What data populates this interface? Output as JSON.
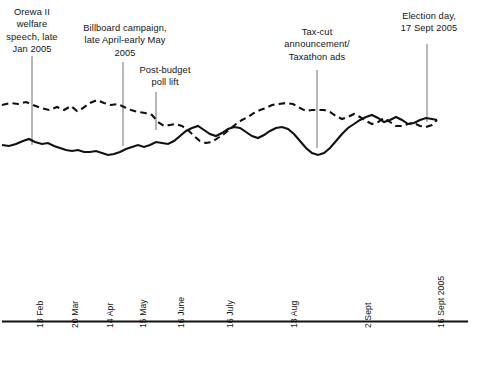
{
  "chart_data": {
    "type": "line",
    "title": "",
    "subtitle": "",
    "xlabel": "",
    "ylabel": "",
    "grid": false,
    "legend_position": "none",
    "x_axis": {
      "tick_labels": [
        "13 Feb",
        "20 Mar",
        "14 Apr",
        "15 May",
        "16 June",
        "16 July",
        "13 Aug",
        "2 Sept",
        "16 Sept 2005"
      ],
      "tick_positions_px": [
        31,
        66,
        101,
        134,
        172,
        221,
        285,
        359,
        432
      ],
      "range_start": "13 Feb",
      "range_end": "16 Sept 2005"
    },
    "y_axis": {
      "visible": false,
      "note": "no tick labels or axis line shown"
    },
    "series": [
      {
        "name": "dashed-series",
        "style": "dashed",
        "color": "#111111",
        "points": [
          [
            2,
            105
          ],
          [
            10,
            103
          ],
          [
            18,
            104
          ],
          [
            26,
            102
          ],
          [
            33,
            105
          ],
          [
            41,
            108
          ],
          [
            49,
            110
          ],
          [
            57,
            107
          ],
          [
            64,
            110
          ],
          [
            71,
            106
          ],
          [
            77,
            111
          ],
          [
            83,
            108
          ],
          [
            90,
            103
          ],
          [
            97,
            100
          ],
          [
            104,
            103
          ],
          [
            111,
            105
          ],
          [
            118,
            104
          ],
          [
            124,
            107
          ],
          [
            131,
            110
          ],
          [
            138,
            112
          ],
          [
            145,
            113
          ],
          [
            152,
            115
          ],
          [
            158,
            122
          ],
          [
            164,
            126
          ],
          [
            170,
            125
          ],
          [
            176,
            124
          ],
          [
            182,
            126
          ],
          [
            188,
            130
          ],
          [
            194,
            136
          ],
          [
            200,
            141
          ],
          [
            206,
            143
          ],
          [
            212,
            142
          ],
          [
            218,
            138
          ],
          [
            224,
            134
          ],
          [
            230,
            129
          ],
          [
            236,
            124
          ],
          [
            242,
            120
          ],
          [
            248,
            117
          ],
          [
            254,
            113
          ],
          [
            260,
            110
          ],
          [
            266,
            108
          ],
          [
            272,
            105
          ],
          [
            279,
            104
          ],
          [
            286,
            103
          ],
          [
            293,
            104
          ],
          [
            300,
            108
          ],
          [
            306,
            111
          ],
          [
            312,
            110
          ],
          [
            318,
            110
          ],
          [
            324,
            110
          ],
          [
            330,
            112
          ],
          [
            336,
            116
          ],
          [
            342,
            119
          ],
          [
            348,
            117
          ],
          [
            354,
            114
          ],
          [
            360,
            117
          ],
          [
            366,
            121
          ],
          [
            372,
            124
          ],
          [
            378,
            122
          ],
          [
            384,
            118
          ],
          [
            390,
            122
          ],
          [
            396,
            126
          ],
          [
            402,
            126
          ],
          [
            408,
            124
          ],
          [
            414,
            123
          ],
          [
            420,
            126
          ],
          [
            426,
            127
          ],
          [
            432,
            125
          ],
          [
            437,
            120
          ]
        ]
      },
      {
        "name": "solid-series",
        "style": "solid",
        "color": "#111111",
        "points": [
          [
            2,
            145
          ],
          [
            9,
            146
          ],
          [
            16,
            144
          ],
          [
            23,
            141
          ],
          [
            29,
            139
          ],
          [
            35,
            142
          ],
          [
            42,
            144
          ],
          [
            48,
            143
          ],
          [
            54,
            146
          ],
          [
            60,
            148
          ],
          [
            66,
            150
          ],
          [
            72,
            151
          ],
          [
            78,
            150
          ],
          [
            84,
            152
          ],
          [
            90,
            152
          ],
          [
            96,
            151
          ],
          [
            102,
            153
          ],
          [
            108,
            155
          ],
          [
            114,
            154
          ],
          [
            120,
            152
          ],
          [
            126,
            149
          ],
          [
            132,
            147
          ],
          [
            138,
            145
          ],
          [
            144,
            147
          ],
          [
            150,
            145
          ],
          [
            156,
            142
          ],
          [
            162,
            143
          ],
          [
            168,
            144
          ],
          [
            174,
            141
          ],
          [
            180,
            136
          ],
          [
            186,
            131
          ],
          [
            192,
            128
          ],
          [
            198,
            126
          ],
          [
            204,
            130
          ],
          [
            210,
            134
          ],
          [
            216,
            136
          ],
          [
            222,
            133
          ],
          [
            228,
            129
          ],
          [
            234,
            127
          ],
          [
            240,
            128
          ],
          [
            246,
            132
          ],
          [
            252,
            136
          ],
          [
            258,
            138
          ],
          [
            264,
            135
          ],
          [
            270,
            131
          ],
          [
            276,
            128
          ],
          [
            282,
            127
          ],
          [
            288,
            129
          ],
          [
            294,
            134
          ],
          [
            300,
            141
          ],
          [
            306,
            148
          ],
          [
            312,
            153
          ],
          [
            318,
            155
          ],
          [
            324,
            153
          ],
          [
            330,
            148
          ],
          [
            336,
            141
          ],
          [
            342,
            134
          ],
          [
            348,
            128
          ],
          [
            354,
            124
          ],
          [
            360,
            120
          ],
          [
            366,
            117
          ],
          [
            372,
            115
          ],
          [
            378,
            118
          ],
          [
            384,
            122
          ],
          [
            390,
            120
          ],
          [
            396,
            117
          ],
          [
            402,
            120
          ],
          [
            408,
            124
          ],
          [
            414,
            123
          ],
          [
            420,
            120
          ],
          [
            426,
            118
          ],
          [
            432,
            119
          ],
          [
            437,
            120
          ]
        ]
      }
    ],
    "annotations": [
      {
        "id": "orewa",
        "text": "Orewa II\nwelfare\nspeech, late\nJan 2005",
        "leader_x": 32,
        "leader_y_top": 56,
        "leader_y_bottom": 145
      },
      {
        "id": "billboard",
        "text": "Billboard campaign,\nlate April-early May\n2005",
        "leader_x": 123,
        "leader_y_top": 62,
        "leader_y_bottom": 146
      },
      {
        "id": "postbudget",
        "text": "Post-budget\npoll lift",
        "leader_x": 156,
        "leader_y_top": 92,
        "leader_y_bottom": 130
      },
      {
        "id": "taxcut",
        "text": "Tax-cut\nannouncement/\nTaxathon ads",
        "leader_x": 317,
        "leader_y_top": 70,
        "leader_y_bottom": 148
      },
      {
        "id": "election",
        "text": "Election day,\n17 Sept 2005",
        "leader_x": 427,
        "leader_y_top": 44,
        "leader_y_bottom": 122
      }
    ]
  },
  "annotations_text": {
    "orewa": "Orewa II\nwelfare\nspeech, late\nJan 2005",
    "billboard": "Billboard campaign,\nlate April-early May\n2005",
    "postbudget": "Post-budget\npoll lift",
    "taxcut": "Tax-cut\nannouncement/\nTaxathon ads",
    "election": "Election day,\n17 Sept 2005"
  },
  "x_tick_labels": {
    "t0": "13 Feb",
    "t1": "20 Mar",
    "t2": "14 Apr",
    "t3": "15 May",
    "t4": "16 June",
    "t5": "16 July",
    "t6": "13 Aug",
    "t7": "2 Sept",
    "t8": "16 Sept 2005"
  }
}
